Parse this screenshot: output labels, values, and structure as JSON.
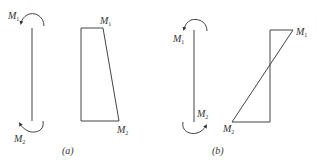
{
  "figure": {
    "panels": [
      {
        "id": "a",
        "caption": "(a)",
        "beam": {
          "top_moment": {
            "symbol": "M",
            "subscript": "1",
            "direction": "counterclockwise"
          },
          "bottom_moment": {
            "symbol": "M",
            "subscript": "2",
            "direction": "clockwise"
          }
        },
        "moment_diagram": {
          "shape": "trapezoid",
          "top_label": {
            "symbol": "M",
            "subscript": "1"
          },
          "bottom_label": {
            "symbol": "M",
            "subscript": "2"
          }
        }
      },
      {
        "id": "b",
        "caption": "(b)",
        "beam": {
          "top_moment": {
            "symbol": "M",
            "subscript": "1",
            "direction": "counterclockwise"
          },
          "bottom_moment": {
            "symbol": "M",
            "subscript": "2",
            "direction": "counterclockwise"
          }
        },
        "moment_diagram": {
          "shape": "crossing-triangles",
          "top_label": {
            "symbol": "M",
            "subscript": "1"
          },
          "bottom_label": {
            "symbol": "M",
            "subscript": "2"
          }
        }
      }
    ],
    "colors": {
      "stroke": "#444444",
      "text": "#333333",
      "background": "#ffffff"
    }
  }
}
